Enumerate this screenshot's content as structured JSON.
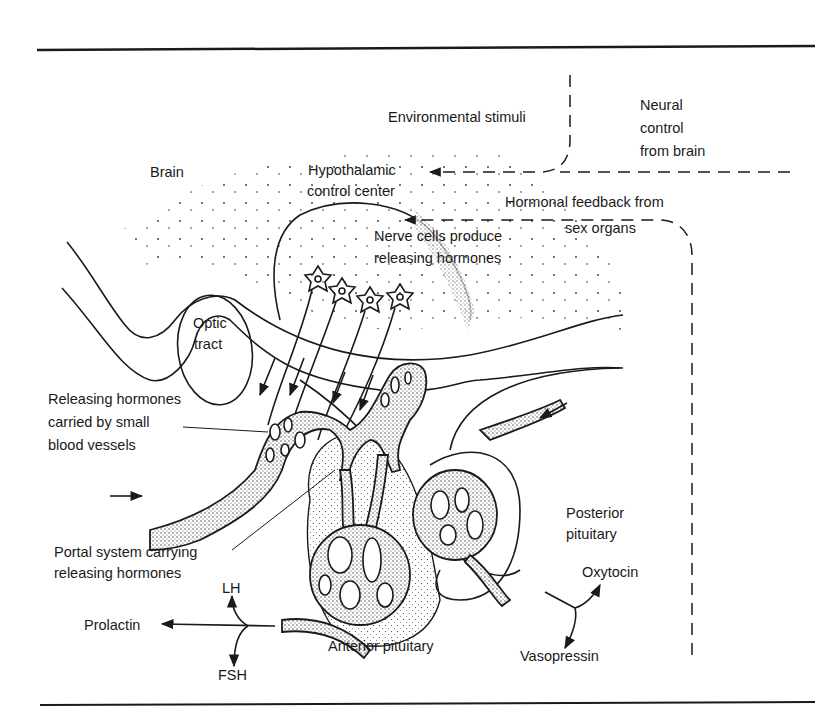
{
  "diagram": {
    "labels": {
      "environmental_stimuli": "Environmental stimuli",
      "neural_control_1": "Neural",
      "neural_control_2": "control",
      "neural_control_3": "from brain",
      "brain": "Brain",
      "hypothalamic_1": "Hypothalamic",
      "hypothalamic_2": "control center",
      "hormonal_feedback_1": "Hormonal feedback from",
      "hormonal_feedback_2": "sex organs",
      "nerve_cells_1": "Nerve cells produce",
      "nerve_cells_2": "releasing hormones",
      "optic_1": "Optic",
      "optic_2": "tract",
      "releasing_small_1": "Releasing hormones",
      "releasing_small_2": "carried by small",
      "releasing_small_3": "blood vessels",
      "portal_1": "Portal system carrying",
      "portal_2": "releasing hormones",
      "posterior_1": "Posterior",
      "posterior_2": "pituitary",
      "anterior": "Anterior pituitary",
      "oxytocin": "Oxytocin",
      "vasopressin": "Vasopressin",
      "lh": "LH",
      "prolactin": "Prolactin",
      "fsh": "FSH"
    }
  }
}
